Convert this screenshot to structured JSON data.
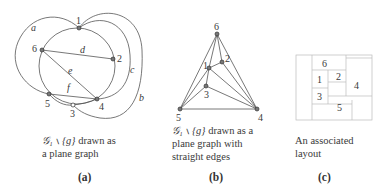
{
  "panels": {
    "a": {
      "label": "(a)",
      "caption_line1": "≧₁ ∖ {g} drawn as",
      "caption_math": "𝒢₁ ∖ {g}",
      "caption_rest1": " drawn as",
      "caption_line2": "a plane graph",
      "vertices": [
        {
          "id": "1",
          "x": 79,
          "y": 28
        },
        {
          "id": "2",
          "x": 113,
          "y": 59
        },
        {
          "id": "3",
          "x": 73,
          "y": 105
        },
        {
          "id": "4",
          "x": 97,
          "y": 99
        },
        {
          "id": "5",
          "x": 49,
          "y": 94
        },
        {
          "id": "6",
          "x": 42,
          "y": 50
        }
      ],
      "edge_labels": [
        "a",
        "b",
        "c",
        "d",
        "e",
        "f"
      ]
    },
    "b": {
      "label": "(b)",
      "caption_math": "𝒢₁ ∖ {g}",
      "caption_rest1": " drawn as a",
      "caption_line2": "plane graph with",
      "caption_line3": "straight edges",
      "vertices": [
        {
          "id": "1",
          "x": 209,
          "y": 68
        },
        {
          "id": "2",
          "x": 222,
          "y": 62
        },
        {
          "id": "3",
          "x": 206,
          "y": 86
        },
        {
          "id": "4",
          "x": 257,
          "y": 109
        },
        {
          "id": "5",
          "x": 180,
          "y": 109
        },
        {
          "id": "6",
          "x": 217,
          "y": 34
        }
      ]
    },
    "c": {
      "label": "(c)",
      "caption_line1": "An associated",
      "caption_line2": "layout",
      "rooms": [
        "6",
        "1",
        "2",
        "4",
        "3",
        "5"
      ]
    }
  },
  "vertex_labels": {
    "v1": "1",
    "v2": "2",
    "v3": "3",
    "v4": "4",
    "v5": "5",
    "v6": "6"
  },
  "edge_labels": {
    "a": "a",
    "b": "b",
    "c": "c",
    "d": "d",
    "e": "e",
    "f": "f"
  }
}
